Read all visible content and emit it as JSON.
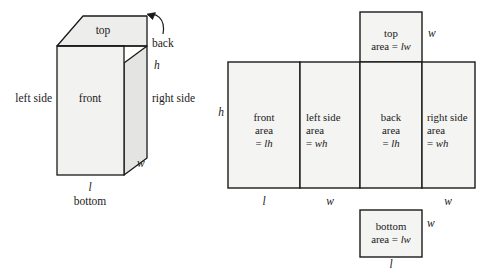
{
  "figure": {
    "colors": {
      "stroke": "#1a1a1a",
      "face_front": "#f2f2f0",
      "face_side": "#e4e4e2",
      "face_top": "#ededeb",
      "panel_fill": "#f4f4f2",
      "text": "#1a1a1a",
      "background": "#ffffff"
    }
  },
  "solid": {
    "name": "rectangular-prism",
    "faces": {
      "top": "top",
      "front": "front",
      "right_side": "right side",
      "left_side": "left side",
      "back": "back",
      "bottom": "bottom"
    },
    "dimensions": {
      "height": "h",
      "length": "l",
      "width": "w"
    }
  },
  "net": {
    "name": "unfolded-net",
    "panels": [
      {
        "id": "top",
        "lines": [
          "top",
          "area = lw"
        ],
        "label": "top",
        "area_text": "area = lw",
        "area_expr": "lw"
      },
      {
        "id": "front",
        "lines": [
          "front",
          "area",
          "= lh"
        ],
        "label": "front",
        "area_word": "area",
        "area_expr": "= lh"
      },
      {
        "id": "left-side",
        "lines": [
          "left side",
          "area",
          "= wh"
        ],
        "label": "left side",
        "area_word": "area",
        "area_expr": "= wh"
      },
      {
        "id": "back",
        "lines": [
          "back",
          "area",
          "= lh"
        ],
        "label": "back",
        "area_word": "area",
        "area_expr": "= lh"
      },
      {
        "id": "right-side",
        "lines": [
          "right side",
          "area",
          "= wh"
        ],
        "label": "right side",
        "area_word": "area",
        "area_expr": "= wh"
      },
      {
        "id": "bottom",
        "lines": [
          "bottom",
          "area = lw"
        ],
        "label": "bottom",
        "area_text": "area = lw",
        "area_expr": "lw"
      }
    ],
    "dimension_labels": {
      "left_height": "h",
      "top_right_width": "w",
      "front_length": "l",
      "left_side_width": "w",
      "right_side_width": "w",
      "bottom_right_width": "w",
      "bottom_length": "l"
    }
  }
}
